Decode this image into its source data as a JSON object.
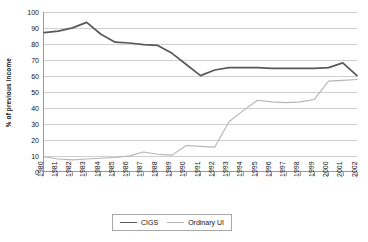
{
  "chart_data": {
    "type": "line",
    "title": "",
    "xlabel": "",
    "ylabel": "% of previous income",
    "ylim": [
      0,
      100
    ],
    "ytick_step": 10,
    "grid": true,
    "legend_position": "bottom-center",
    "categories": [
      "1980",
      "1981",
      "1982",
      "1983",
      "1984",
      "1985",
      "1986",
      "1987",
      "1988",
      "1989",
      "1990",
      "1991",
      "1992",
      "1993",
      "1994",
      "1995",
      "1996",
      "1997",
      "1998",
      "1999",
      "2000",
      "2001",
      "2002"
    ],
    "series": [
      {
        "name": "CIGS",
        "color": "#595959",
        "values": [
          87,
          88,
          90,
          93.5,
          86,
          81,
          80.5,
          79.5,
          79,
          74,
          67,
          60,
          63.5,
          65,
          65,
          65,
          64.5,
          64.5,
          64.5,
          64.5,
          65,
          68,
          60
        ]
      },
      {
        "name": "Ordinary UI",
        "color": "#b5b5b5",
        "values": [
          9,
          7.5,
          7,
          7.5,
          8,
          8.5,
          9.5,
          12,
          10.5,
          10,
          16,
          15.5,
          15,
          31,
          38,
          44.5,
          43.5,
          43,
          43.5,
          45,
          56.5,
          57,
          57.5
        ]
      }
    ],
    "ytick_labels": [
      "0",
      "10",
      "20",
      "30",
      "40",
      "50",
      "60",
      "70",
      "80",
      "90",
      "100"
    ]
  },
  "legend": {
    "entries": [
      {
        "label": "CIGS",
        "color": "#595959"
      },
      {
        "label": "Ordinary UI",
        "color": "#b5b5b5"
      }
    ]
  },
  "axis": {
    "y_title": "% of previous income"
  }
}
